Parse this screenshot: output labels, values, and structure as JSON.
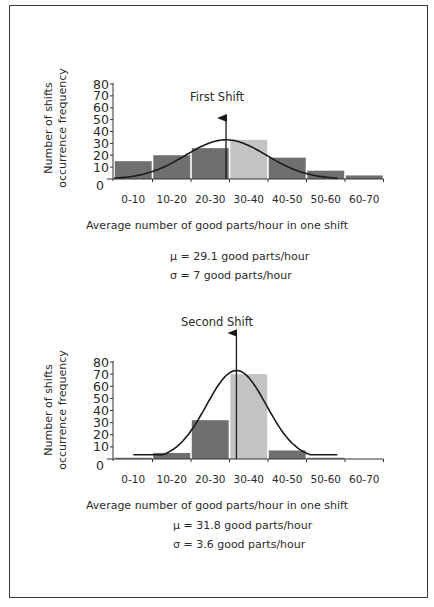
{
  "chart_data": [
    {
      "type": "bar",
      "title": "First Shift",
      "xlabel": "Average number of good parts/hour in one shift",
      "ylabel": [
        "Number of shifts",
        "occurrence frequency"
      ],
      "ylim": [
        0,
        80
      ],
      "yticks": [
        "0",
        "10",
        "20",
        "30",
        "40",
        "50",
        "60",
        "70",
        "80"
      ],
      "categories": [
        "0-10",
        "10-20",
        "20-30",
        "30-40",
        "40-50",
        "50-60",
        "60-70"
      ],
      "values": [
        15,
        20,
        26,
        33,
        18,
        7,
        3
      ],
      "highlight_index": 3,
      "mean": 29.1,
      "std": 7,
      "curve_peak": 33,
      "stats": [
        "μ = 29.1 good parts/hour",
        "σ = 7 good parts/hour"
      ],
      "grid": false
    },
    {
      "type": "bar",
      "title": "Second Shift",
      "xlabel": "Average number of good parts/hour in one shift",
      "ylabel": [
        "Number of shifts",
        "occurrence frequency"
      ],
      "ylim": [
        0,
        80
      ],
      "yticks": [
        "0",
        "10",
        "20",
        "30",
        "40",
        "50",
        "60",
        "70",
        "80"
      ],
      "categories": [
        "0-10",
        "10-20",
        "20-30",
        "30-40",
        "40-50",
        "50-60",
        "60-70"
      ],
      "values": [
        1,
        5,
        32,
        70,
        7,
        1,
        0
      ],
      "highlight_index": 3,
      "mean": 31.8,
      "std": 3.6,
      "curve_peak": 73,
      "stats": [
        "μ = 31.8 good parts/hour",
        "σ = 3.6 good parts/hour"
      ],
      "grid": false
    }
  ],
  "colors": {
    "bar": "#6f6f6f",
    "bar_highlight": "#c4c4c4",
    "line": "#1a1a1a",
    "frame": "#3a3a3a"
  }
}
